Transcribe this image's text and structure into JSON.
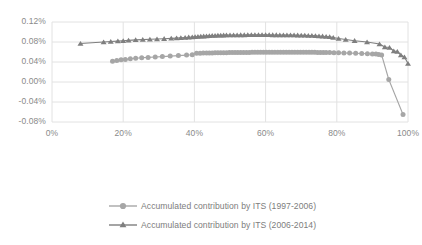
{
  "chart_data": {
    "type": "line",
    "title": "",
    "xlabel": "",
    "ylabel": "",
    "grid": true,
    "legend_position": "bottom",
    "xlim": [
      0,
      100
    ],
    "ylim": [
      -0.08,
      0.12
    ],
    "x_ticks": [
      "0%",
      "20%",
      "40%",
      "60%",
      "80%",
      "100%"
    ],
    "x_tick_values": [
      0,
      20,
      40,
      60,
      80,
      100
    ],
    "y_ticks": [
      "0.12%",
      "0.08%",
      "0.04%",
      "0.00%",
      "-0.04%",
      "-0.08%"
    ],
    "y_tick_values": [
      0.12,
      0.08,
      0.04,
      0.0,
      -0.04,
      -0.08
    ],
    "series": [
      {
        "name": "Accumulated contribution by ITS (1997-2006)",
        "marker": "circle",
        "color": "#a6a6a6",
        "x": [
          17.0,
          18.2,
          19.4,
          20.6,
          22.0,
          23.5,
          25.2,
          27.0,
          29.0,
          31.0,
          33.2,
          35.5,
          37.8,
          39.4,
          40.6,
          41.6,
          42.5,
          43.4,
          44.2,
          45.0,
          45.8,
          46.6,
          47.4,
          48.2,
          49.0,
          49.8,
          50.6,
          51.4,
          52.2,
          53.0,
          53.8,
          54.6,
          55.4,
          56.2,
          57.0,
          57.8,
          58.6,
          59.4,
          60.2,
          61.0,
          61.8,
          62.6,
          63.4,
          64.2,
          65.0,
          65.8,
          66.6,
          67.4,
          68.2,
          69.0,
          69.8,
          70.6,
          71.4,
          72.2,
          73.0,
          73.8,
          74.6,
          75.4,
          76.2,
          77.0,
          78.0,
          79.2,
          80.5,
          82.0,
          83.6,
          85.3,
          87.0,
          88.6,
          90.0,
          91.0,
          91.8,
          92.6,
          94.6,
          98.6
        ],
        "y": [
          0.0415,
          0.0432,
          0.0444,
          0.0452,
          0.0464,
          0.0474,
          0.0484,
          0.0492,
          0.05,
          0.0508,
          0.0518,
          0.0528,
          0.0538,
          0.0544,
          0.0574,
          0.0576,
          0.0578,
          0.058,
          0.0581,
          0.0582,
          0.0583,
          0.0584,
          0.0585,
          0.0586,
          0.0587,
          0.0588,
          0.0589,
          0.059,
          0.059,
          0.0591,
          0.0591,
          0.0592,
          0.0592,
          0.0593,
          0.0593,
          0.0594,
          0.0594,
          0.0594,
          0.0595,
          0.0595,
          0.0595,
          0.0595,
          0.0596,
          0.0596,
          0.0596,
          0.0596,
          0.0596,
          0.0596,
          0.0596,
          0.0595,
          0.0595,
          0.0595,
          0.0594,
          0.0594,
          0.0593,
          0.0593,
          0.0592,
          0.0591,
          0.059,
          0.0589,
          0.0588,
          0.0586,
          0.0584,
          0.0581,
          0.0578,
          0.0574,
          0.057,
          0.0566,
          0.0562,
          0.0558,
          0.0552,
          0.054,
          0.005,
          -0.065
        ]
      },
      {
        "name": "Accumulated contribution by ITS (2006-2014)",
        "marker": "triangle",
        "color": "#7f7f7f",
        "x": [
          8.0,
          14.5,
          16.5,
          18.5,
          20.0,
          21.5,
          23.5,
          25.5,
          27.5,
          29.5,
          31.5,
          33.5,
          35.0,
          36.2,
          37.4,
          38.4,
          39.4,
          40.2,
          41.0,
          41.8,
          42.6,
          43.4,
          44.2,
          45.0,
          45.8,
          46.6,
          47.4,
          48.2,
          49.0,
          50.0,
          51.0,
          52.0,
          53.0,
          54.0,
          55.0,
          56.0,
          57.0,
          58.0,
          59.0,
          60.0,
          61.0,
          62.0,
          63.0,
          64.0,
          65.0,
          66.0,
          67.0,
          68.0,
          69.0,
          70.0,
          71.0,
          72.0,
          73.0,
          74.0,
          75.0,
          76.0,
          77.0,
          78.0,
          79.0,
          80.5,
          82.5,
          85.0,
          88.5,
          92.0,
          93.5,
          94.8,
          96.0,
          97.0,
          98.0,
          99.0,
          100.0
        ],
        "y": [
          0.077,
          0.08,
          0.081,
          0.0818,
          0.0824,
          0.0832,
          0.0842,
          0.0848,
          0.0854,
          0.086,
          0.0866,
          0.0872,
          0.0878,
          0.0884,
          0.089,
          0.0896,
          0.09,
          0.0904,
          0.0908,
          0.0912,
          0.0916,
          0.092,
          0.0924,
          0.0928,
          0.093,
          0.0932,
          0.0934,
          0.0936,
          0.0938,
          0.0939,
          0.094,
          0.094,
          0.0941,
          0.0941,
          0.0942,
          0.0942,
          0.0942,
          0.0942,
          0.0942,
          0.0942,
          0.0942,
          0.0941,
          0.0941,
          0.094,
          0.094,
          0.0939,
          0.0938,
          0.0937,
          0.0936,
          0.0934,
          0.0932,
          0.093,
          0.0927,
          0.0924,
          0.092,
          0.0916,
          0.091,
          0.0902,
          0.089,
          0.087,
          0.085,
          0.0826,
          0.08,
          0.076,
          0.07,
          0.069,
          0.062,
          0.061,
          0.054,
          0.05,
          0.037
        ]
      }
    ]
  },
  "legend": {
    "items": [
      {
        "label": "Accumulated contribution by ITS (1997-2006)",
        "marker": "circle-marker"
      },
      {
        "label": "Accumulated contribution by ITS (2006-2014)",
        "marker": "triangle-marker"
      }
    ]
  },
  "colors": {
    "series1": "#a6a6a6",
    "series2": "#7f7f7f",
    "grid": "#e2e2e2",
    "axis_text": "#8a8a8a",
    "legend_text": "#7d7d7d",
    "background": "#ffffff"
  }
}
